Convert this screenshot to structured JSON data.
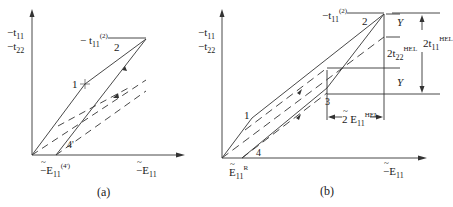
{
  "panel_a": {
    "caption": "(a)",
    "y_label_1": "−t",
    "y_label_1_sub": "11",
    "y_label_2": "−t",
    "y_label_2_sub": "22",
    "peak_label": "− t",
    "peak_label_sub": "11",
    "peak_label_sup": "(2)",
    "point_1": "1",
    "point_2": "2",
    "point_4p": "4'",
    "x_origin_label": "−E",
    "x_origin_sub": "11",
    "x_origin_sup": "(4')",
    "x_axis_label": "−E",
    "x_axis_sub": "11"
  },
  "panel_b": {
    "caption": "(b)",
    "y_label_1": "−t",
    "y_label_1_sub": "11",
    "y_label_2": "−t",
    "y_label_2_sub": "22",
    "peak_label": "−t",
    "peak_label_sub": "11",
    "peak_label_sup": "(2)",
    "point_1": "1",
    "point_2": "2",
    "point_3": "3",
    "point_4": "4",
    "x_origin_label": "E",
    "x_origin_sub": "11",
    "x_origin_sup": "R",
    "x_axis_label": "−E",
    "x_axis_sub": "11",
    "y_top": "Y",
    "y_bottom": "Y",
    "t22_label": "2t",
    "t22_sub": "22",
    "t22_sup": "HEL",
    "t11_label": "2t",
    "t11_sub": "11",
    "t11_sup": "HEL",
    "e11_label": "2 E",
    "e11_sub": "11",
    "e11_sup": "HEL"
  }
}
